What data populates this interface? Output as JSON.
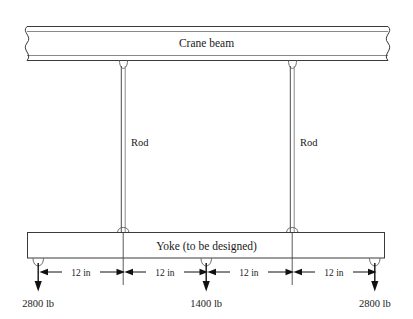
{
  "figure": {
    "title_beam": "Crane beam",
    "yoke_label": "Yoke (to be designed)",
    "rod_label_left": "Rod",
    "rod_label_right": "Rod",
    "dimensions": [
      {
        "label": "12 in"
      },
      {
        "label": "12 in"
      },
      {
        "label": "12 in"
      },
      {
        "label": "12 in"
      }
    ],
    "loads": [
      {
        "label": "2800 lb"
      },
      {
        "label": "1400 lb"
      },
      {
        "label": "2800 lb"
      }
    ],
    "colors": {
      "line": "#3a3a3a",
      "shade": "#9a9a9a",
      "text": "#1a1a1a",
      "background": "#ffffff"
    }
  }
}
